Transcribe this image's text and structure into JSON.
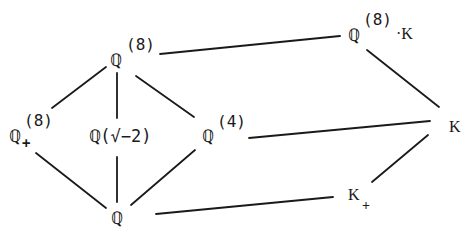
{
  "diagram": {
    "type": "field-extension-lattice",
    "nodes": {
      "q8": {
        "base": "ℚ",
        "sup": "(8)",
        "label": "ℚ^(8)"
      },
      "q8k": {
        "base": "ℚ",
        "sup": "(8)",
        "suffix": "·K",
        "label": "ℚ^(8)·K"
      },
      "q8plus": {
        "base": "ℚ",
        "sup": "(8)",
        "sub": "+",
        "label": "ℚ_+^(8)"
      },
      "qsqrt": {
        "base": "ℚ",
        "rest": "(√−2)",
        "label": "ℚ(√−2)"
      },
      "q4": {
        "base": "ℚ",
        "sup": "(4)",
        "label": "ℚ^(4)"
      },
      "k": {
        "base": "K",
        "label": "K"
      },
      "q": {
        "base": "ℚ",
        "label": "ℚ"
      },
      "kplus": {
        "base": "K",
        "sub": "+",
        "label": "K_+"
      }
    },
    "edges": [
      [
        "q8",
        "q8plus"
      ],
      [
        "q8",
        "qsqrt"
      ],
      [
        "q8",
        "q4"
      ],
      [
        "q8",
        "q8k"
      ],
      [
        "q8k",
        "k"
      ],
      [
        "q8plus",
        "q"
      ],
      [
        "qsqrt",
        "q"
      ],
      [
        "q4",
        "q"
      ],
      [
        "q4",
        "k"
      ],
      [
        "q",
        "kplus"
      ],
      [
        "kplus",
        "k"
      ]
    ],
    "colors": {
      "ink": "#1a1a1a",
      "background": "#ffffff"
    }
  }
}
